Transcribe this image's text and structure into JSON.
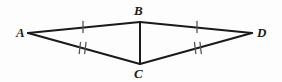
{
  "figure": {
    "type": "geometry-diagram",
    "width": 282,
    "height": 82,
    "background_color": "#fdfdfd",
    "stroke_color": "#1a1a1a",
    "tick_color": "#555555",
    "labels": {
      "A": "A",
      "B": "B",
      "C": "C",
      "D": "D"
    },
    "vertices": [
      {
        "name": "A",
        "label": "A",
        "x": 28,
        "y": 33
      },
      {
        "name": "B",
        "label": "B",
        "x": 140,
        "y": 22
      },
      {
        "name": "C",
        "label": "C",
        "x": 140,
        "y": 64
      },
      {
        "name": "D",
        "label": "D",
        "x": 252,
        "y": 33
      }
    ],
    "segments": [
      {
        "name": "AB",
        "from": "A",
        "to": "B",
        "x1": 28,
        "y1": 33,
        "x2": 140,
        "y2": 22,
        "ticks": 1
      },
      {
        "name": "BD",
        "from": "B",
        "to": "D",
        "x1": 140,
        "y1": 22,
        "x2": 252,
        "y2": 33,
        "ticks": 1
      },
      {
        "name": "AC",
        "from": "A",
        "to": "C",
        "x1": 28,
        "y1": 33,
        "x2": 140,
        "y2": 64,
        "ticks": 2
      },
      {
        "name": "CD",
        "from": "C",
        "to": "D",
        "x1": 140,
        "y1": 64,
        "x2": 252,
        "y2": 33,
        "ticks": 2
      },
      {
        "name": "BC",
        "from": "B",
        "to": "C",
        "x1": 140,
        "y1": 22,
        "x2": 140,
        "y2": 64,
        "ticks": 0
      }
    ],
    "tick_marks": [
      {
        "name": "tick-AB",
        "segment": "AB",
        "count": 1,
        "x": 83,
        "y": 27
      },
      {
        "name": "tick-BD",
        "segment": "BD",
        "count": 1,
        "x": 197,
        "y": 27
      },
      {
        "name": "tick-AC",
        "segment": "AC",
        "count": 2,
        "x": 83,
        "y": 48
      },
      {
        "name": "tick-CD",
        "segment": "CD",
        "count": 2,
        "x": 197,
        "y": 48
      }
    ]
  }
}
